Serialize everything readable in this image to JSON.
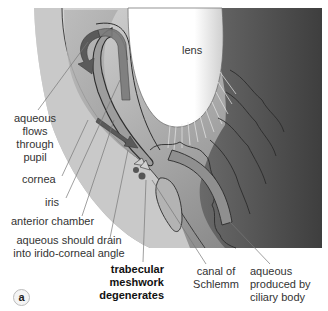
{
  "figure": {
    "panel_label": "a",
    "colors": {
      "dark_tissue": "#4a4a4a",
      "mid_tissue": "#8c8c8c",
      "light_tissue": "#bdbdbd",
      "lens": "#ffffff",
      "arrow": "#555555",
      "leader_line": "#777777"
    }
  },
  "labels": {
    "lens": "lens",
    "aqueous_flows": [
      "aqueous",
      "flows",
      "through",
      "pupil"
    ],
    "cornea": "cornea",
    "iris": "iris",
    "anterior_chamber": "anterior chamber",
    "aqueous_should_drain": [
      "aqueous should drain",
      "into irido-corneal angle"
    ],
    "trabecular": [
      "trabecular",
      "meshwork",
      "degenerates"
    ],
    "canal": [
      "canal of",
      "Schlemm"
    ],
    "aqueous_produced": [
      "aqueous",
      "produced by",
      "ciliary body"
    ]
  }
}
